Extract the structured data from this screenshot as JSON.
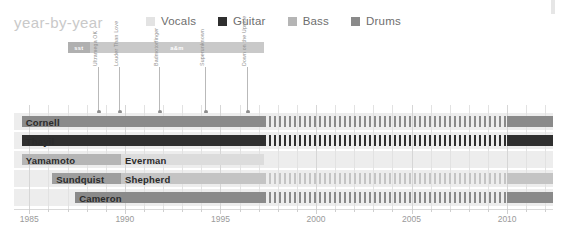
{
  "title": "year-by-year",
  "legend": [
    {
      "label": "Vocals",
      "color": "#e3e3e3",
      "icon": "square-swatch"
    },
    {
      "label": "Guitar",
      "color": "#2f2f2f",
      "icon": "square-swatch"
    },
    {
      "label": "Bass",
      "color": "#b5b5b5",
      "icon": "square-swatch"
    },
    {
      "label": "Drums",
      "color": "#8a8a8a",
      "icon": "square-swatch"
    }
  ],
  "record_labels": [
    {
      "name": "sst",
      "start": 1987.0,
      "end": 1988.2,
      "color": "#b0b0b0"
    },
    {
      "name": "a&m",
      "start": 1988.2,
      "end": 1997.3,
      "color": "#c9c9c9"
    }
  ],
  "albums": [
    {
      "name": "Ultramega OK",
      "year": 1988.6
    },
    {
      "name": "Louder Than Love",
      "year": 1989.7
    },
    {
      "name": "Badmotorfinger",
      "year": 1991.8
    },
    {
      "name": "Superunknown",
      "year": 1994.2
    },
    {
      "name": "Down on the Upside",
      "year": 1996.4
    }
  ],
  "axis": {
    "ticks": [
      1985,
      1990,
      1995,
      2000,
      2005,
      2010
    ],
    "minor_step": 1,
    "min": 1984.2,
    "max": 2012.4
  },
  "chart_data": {
    "type": "bar",
    "title": "year-by-year",
    "xlabel": "",
    "ylabel": "",
    "xlim": [
      1984.2,
      2012.4
    ],
    "grid": true,
    "legend_position": "top",
    "categories": [
      "Cornell",
      "Thayil",
      "Yamamoto",
      "Everman",
      "Sundquist",
      "Shepherd",
      "Cameron"
    ],
    "series": [
      {
        "name": "Cornell",
        "row": 0,
        "instrument": "Vocals",
        "color": "#8a8a8a",
        "segments": [
          {
            "start": 1984.6,
            "end": 1997.3,
            "style": "solid"
          },
          {
            "start": 1997.3,
            "end": 2010.0,
            "style": "hatched"
          },
          {
            "start": 2010.0,
            "end": 2012.4,
            "style": "solid"
          }
        ]
      },
      {
        "name": "Thayil",
        "row": 1,
        "instrument": "Guitar",
        "color": "#2f2f2f",
        "segments": [
          {
            "start": 1984.6,
            "end": 1997.3,
            "style": "solid"
          },
          {
            "start": 1997.3,
            "end": 2010.0,
            "style": "hatched"
          },
          {
            "start": 2010.0,
            "end": 2012.4,
            "style": "solid"
          }
        ]
      },
      {
        "name": "Yamamoto",
        "row": 2,
        "instrument": "Bass",
        "color": "#b5b5b5",
        "segments": [
          {
            "start": 1984.6,
            "end": 1989.8,
            "style": "solid"
          }
        ]
      },
      {
        "name": "Everman",
        "row": 2,
        "instrument": "Bass",
        "color": "#dcdcdc",
        "segments": [
          {
            "start": 1989.8,
            "end": 1997.3,
            "style": "solid"
          }
        ]
      },
      {
        "name": "Sundquist",
        "row": 3,
        "instrument": "Drums",
        "color": "#9e9e9e",
        "segments": [
          {
            "start": 1986.2,
            "end": 1989.8,
            "style": "solid"
          }
        ]
      },
      {
        "name": "Shepherd",
        "row": 3,
        "instrument": "Bass",
        "color": "#c4c4c4",
        "segments": [
          {
            "start": 1989.8,
            "end": 1997.3,
            "style": "solid"
          },
          {
            "start": 1997.3,
            "end": 2010.0,
            "style": "hatched"
          },
          {
            "start": 2010.0,
            "end": 2012.4,
            "style": "solid"
          }
        ]
      },
      {
        "name": "Cameron",
        "row": 4,
        "instrument": "Drums",
        "color": "#8a8a8a",
        "segments": [
          {
            "start": 1987.4,
            "end": 1997.3,
            "style": "solid"
          },
          {
            "start": 1997.3,
            "end": 2010.0,
            "style": "hatched"
          },
          {
            "start": 2010.0,
            "end": 2012.4,
            "style": "solid"
          }
        ]
      }
    ]
  }
}
